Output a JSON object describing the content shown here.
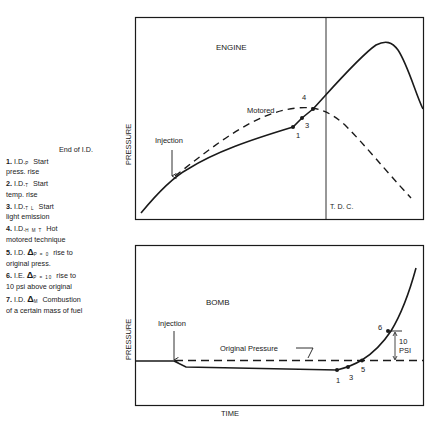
{
  "legend": {
    "title": "End of I.D.",
    "items": [
      {
        "num": "1.",
        "prefix": "I.D.",
        "sub": "P",
        "delta": "",
        "text": "Start",
        "line2": "press. rise"
      },
      {
        "num": "2.",
        "prefix": "I.D.",
        "sub": "T",
        "delta": "",
        "text": "Start",
        "line2": "temp. rise"
      },
      {
        "num": "3.",
        "prefix": "I.D.",
        "sub": "T L",
        "delta": "",
        "text": "Start",
        "line2": "light emission"
      },
      {
        "num": "4.",
        "prefix": "I.D.",
        "sub": "H M T",
        "delta": "",
        "text": "Hot",
        "line2": "motored technique"
      },
      {
        "num": "5.",
        "prefix": "I.D.",
        "sub": "P = 0",
        "delta": "Δ",
        "text": "rise to",
        "line2": "original press."
      },
      {
        "num": "6.",
        "prefix": "I.E.",
        "sub": "P = 10",
        "delta": "Δ",
        "text": "rise to",
        "line2": "10 psi above original"
      },
      {
        "num": "7.",
        "prefix": "I.D.",
        "sub": "M",
        "delta": "Δ",
        "text": "Combustion",
        "line2": "of a certain mass of fuel"
      }
    ]
  },
  "engine_panel": {
    "title": "ENGINE",
    "ylabel": "PRESSURE",
    "injection_label": "Injection",
    "motored_label": "Motored",
    "tdc_label": "T. D. C.",
    "point_labels": [
      "1",
      "3",
      "4"
    ]
  },
  "bomb_panel": {
    "title": "BOMB",
    "ylabel": "PRESSURE",
    "injection_label": "Injection",
    "original_pressure_label": "Original Pressure",
    "point_labels": [
      "1",
      "3",
      "5",
      "6"
    ],
    "delta_label_line1": "10",
    "delta_label_line2": "PSI"
  },
  "xlabel": "TIME",
  "colors": {
    "ink": "#1a1a1a",
    "background": "#ffffff"
  }
}
